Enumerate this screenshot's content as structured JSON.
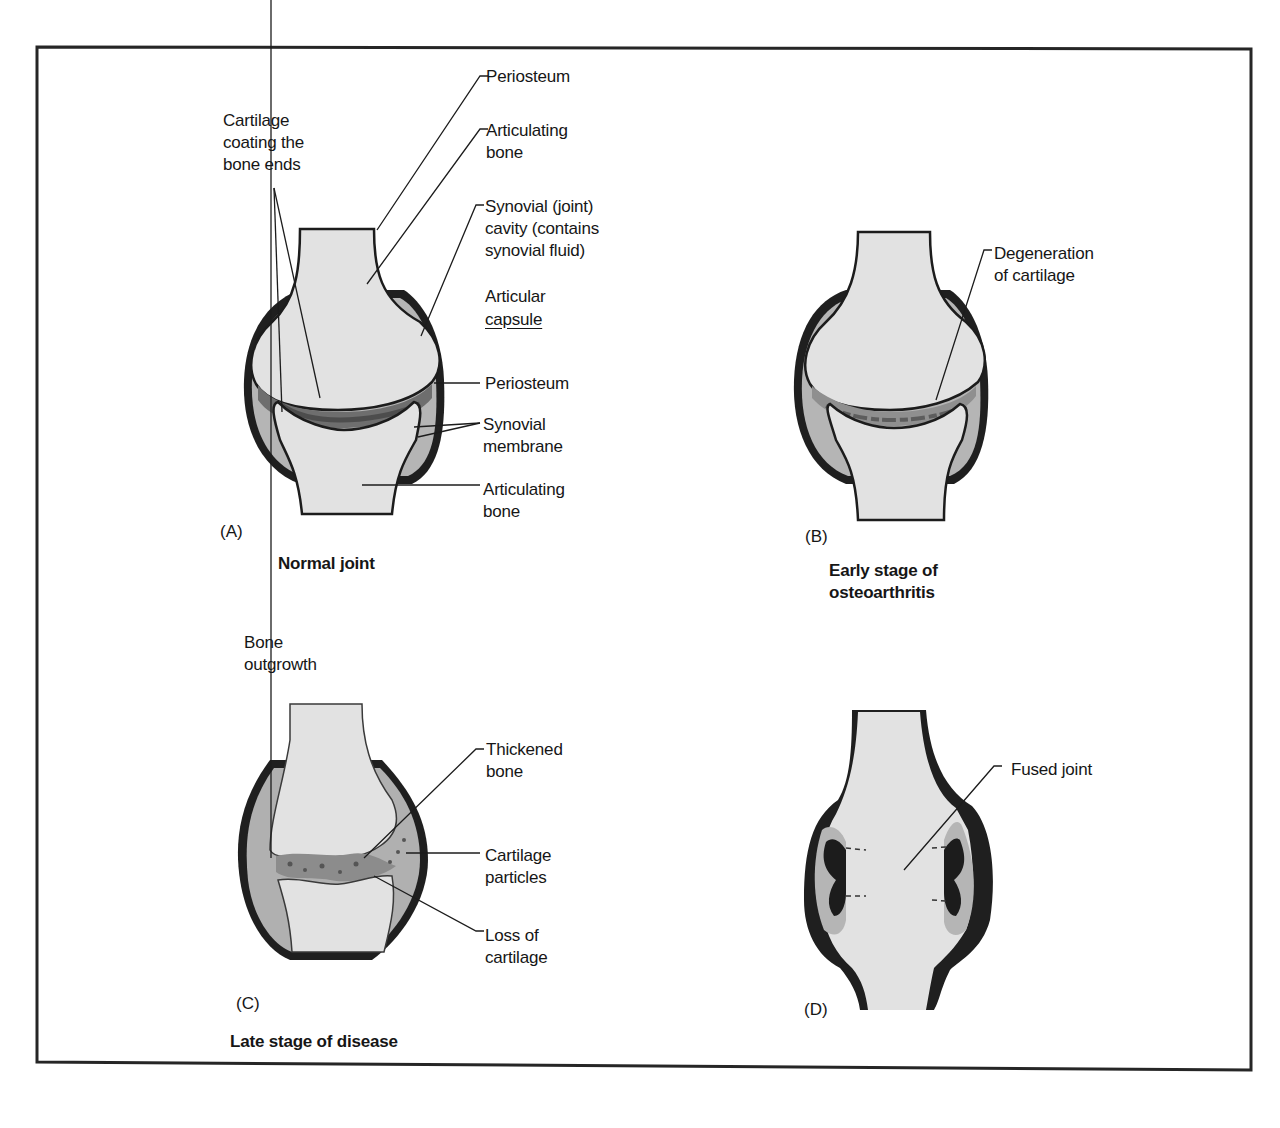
{
  "figure": {
    "panels": [
      {
        "id": "A",
        "letter": "(A)",
        "title": "Normal joint",
        "labels": {
          "cartilage": "Cartilage\ncoating the\nbone ends",
          "periosteum_top": "Periosteum",
          "articulating_bone_top": "Articulating\nbone",
          "synovial_cavity": "Synovial (joint)\ncavity (contains\nsynovial fluid)",
          "articular_capsule_1": "Articular",
          "articular_capsule_2": "capsule",
          "periosteum_mid": "Periosteum",
          "synovial_membrane": "Synovial\nmembrane",
          "articulating_bone_bottom": "Articulating\nbone"
        }
      },
      {
        "id": "B",
        "letter": "(B)",
        "title": "Early stage of\nosteoarthritis",
        "labels": {
          "degeneration": "Degeneration\nof cartilage"
        }
      },
      {
        "id": "C",
        "letter": "(C)",
        "title": "Late stage of disease",
        "labels": {
          "bone_outgrowth": "Bone\noutgrowth",
          "thickened_bone": "Thickened\nbone",
          "cartilage_particles": "Cartilage\nparticles",
          "loss_of_cartilage": "Loss of\ncartilage"
        }
      },
      {
        "id": "D",
        "letter": "(D)",
        "title": "",
        "labels": {
          "fused_joint": "Fused joint"
        }
      }
    ],
    "colors": {
      "bone": "#e4e4e4",
      "cartilage": "#8a8a8a",
      "capsule_fill": "#b9b9b9",
      "outline": "#1c1c1c",
      "frame": "#2a2a2a"
    }
  }
}
